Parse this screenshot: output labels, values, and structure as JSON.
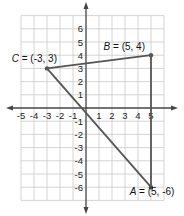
{
  "diagram": {
    "type": "coordinate-plane-triangle",
    "x_range": [
      -5,
      6
    ],
    "y_range": [
      -7,
      7
    ],
    "x_tick_labels": [
      "-5",
      "-4",
      "-3",
      "-2",
      "-1",
      "1",
      "2",
      "3",
      "4",
      "5"
    ],
    "y_tick_labels": [
      "6",
      "5",
      "4",
      "3",
      "2",
      "1",
      "-1",
      "-2",
      "-3",
      "-4",
      "-5",
      "-6"
    ],
    "points": [
      {
        "name": "A",
        "x": 5,
        "y": -6,
        "label": "A = (5, -6)"
      },
      {
        "name": "B",
        "x": 5,
        "y": 4,
        "label": "B = (5, 4)"
      },
      {
        "name": "C",
        "x": -3,
        "y": 3,
        "label": "C = (-3, 3)"
      }
    ],
    "segments": [
      [
        "C",
        "B"
      ],
      [
        "B",
        "A"
      ],
      [
        "A",
        "C"
      ]
    ],
    "colors": {
      "grid": "#c9c9c9",
      "axis": "#444444",
      "triangle": "#555555",
      "point": "#555555",
      "text": "#222222"
    }
  },
  "labels": {
    "A": {
      "name": "A",
      "rest": " = (5, -6)"
    },
    "B": {
      "name": "B",
      "rest": " = (5, 4)"
    },
    "C": {
      "name": "C",
      "rest": " = (-3, 3)"
    }
  }
}
